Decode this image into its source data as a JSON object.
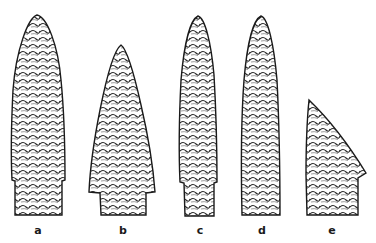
{
  "figure": {
    "ink_color": "#1a1a1a",
    "paper_color": "#ffffff",
    "points": [
      {
        "label": "a",
        "label_x": 38
      },
      {
        "label": "b",
        "label_x": 123
      },
      {
        "label": "c",
        "label_x": 200
      },
      {
        "label": "d",
        "label_x": 262
      },
      {
        "label": "e",
        "label_x": 332
      }
    ]
  }
}
